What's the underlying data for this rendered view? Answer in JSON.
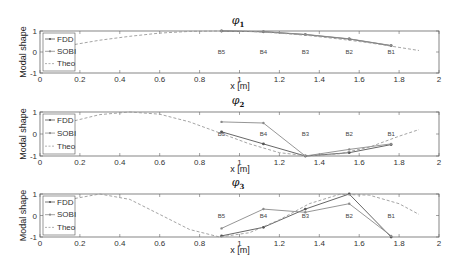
{
  "figure": {
    "ylabel": "Modal shape",
    "xlabel": "x [m]",
    "legend": [
      "FDD",
      "SOBI",
      "Theo"
    ],
    "colors": {
      "FDD": "#555555",
      "SOBI": "#8a8a8a",
      "Theo": "#9a9a9a"
    },
    "xticks": [
      "0",
      "0.2",
      "0.4",
      "0.6",
      "0.8",
      "1",
      "1.2",
      "1.4",
      "1.6",
      "1.8",
      "2"
    ],
    "yticks": [
      "-1",
      "0",
      "1"
    ]
  },
  "chart_data": [
    {
      "type": "line",
      "title": "φ1",
      "title_symbol": "φ",
      "title_sub": "1",
      "xlabel": "x [m]",
      "ylabel": "Modal shape",
      "xlim": [
        0,
        2
      ],
      "ylim": [
        -1,
        1
      ],
      "legend_position": "upper left",
      "annotations": [
        {
          "text": "B5",
          "x": 0.91
        },
        {
          "text": "B4",
          "x": 1.12
        },
        {
          "text": "B3",
          "x": 1.33
        },
        {
          "text": "B2",
          "x": 1.55
        },
        {
          "text": "B1",
          "x": 1.76
        }
      ],
      "series": [
        {
          "name": "FDD",
          "x": [
            0.91,
            1.12,
            1.33,
            1.55,
            1.76
          ],
          "y": [
            1.0,
            0.96,
            0.83,
            0.62,
            0.3
          ]
        },
        {
          "name": "SOBI",
          "x": [
            0.91,
            1.12,
            1.33,
            1.55,
            1.76
          ],
          "y": [
            1.0,
            0.97,
            0.84,
            0.63,
            0.31
          ]
        },
        {
          "name": "Theo",
          "x": [
            0.15,
            0.3,
            0.45,
            0.6,
            0.75,
            0.9,
            1.05,
            1.2,
            1.35,
            1.5,
            1.65,
            1.8,
            1.9
          ],
          "y": [
            0.32,
            0.56,
            0.75,
            0.9,
            0.98,
            1.0,
            0.98,
            0.9,
            0.78,
            0.62,
            0.44,
            0.22,
            0.07
          ]
        }
      ]
    },
    {
      "type": "line",
      "title": "φ2",
      "title_symbol": "φ",
      "title_sub": "2",
      "xlabel": "x [m]",
      "ylabel": "Modal shape",
      "xlim": [
        0,
        2
      ],
      "ylim": [
        -1,
        1
      ],
      "legend_position": "upper left",
      "annotations": [
        {
          "text": "B5",
          "x": 0.91
        },
        {
          "text": "B4",
          "x": 1.12
        },
        {
          "text": "B3",
          "x": 1.33
        },
        {
          "text": "B2",
          "x": 1.55
        },
        {
          "text": "B1",
          "x": 1.76
        }
      ],
      "series": [
        {
          "name": "FDD",
          "x": [
            0.91,
            1.12,
            1.33,
            1.55,
            1.76
          ],
          "y": [
            0.1,
            -0.45,
            -1.0,
            -0.85,
            -0.48
          ]
        },
        {
          "name": "SOBI",
          "x": [
            0.91,
            1.12,
            1.33,
            1.55,
            1.76
          ],
          "y": [
            0.55,
            0.5,
            -1.0,
            -0.7,
            -0.45
          ]
        },
        {
          "name": "Theo",
          "x": [
            0.15,
            0.3,
            0.45,
            0.6,
            0.75,
            0.9,
            1.05,
            1.2,
            1.35,
            1.5,
            1.65,
            1.8,
            1.9
          ],
          "y": [
            0.55,
            0.88,
            1.0,
            0.9,
            0.55,
            0.05,
            -0.45,
            -0.85,
            -1.0,
            -0.9,
            -0.6,
            -0.1,
            0.2
          ]
        }
      ]
    },
    {
      "type": "line",
      "title": "φ3",
      "title_symbol": "φ",
      "title_sub": "3",
      "xlabel": "x [m]",
      "ylabel": "Modal shape",
      "xlim": [
        0,
        2
      ],
      "ylim": [
        -1,
        1
      ],
      "legend_position": "upper left",
      "annotations": [
        {
          "text": "B5",
          "x": 0.91
        },
        {
          "text": "B4",
          "x": 1.12
        },
        {
          "text": "B3",
          "x": 1.33
        },
        {
          "text": "B2",
          "x": 1.55
        },
        {
          "text": "B1",
          "x": 1.76
        }
      ],
      "series": [
        {
          "name": "FDD",
          "x": [
            0.91,
            1.12,
            1.33,
            1.55,
            1.76
          ],
          "y": [
            -0.95,
            -0.55,
            0.3,
            1.0,
            -1.0
          ]
        },
        {
          "name": "SOBI",
          "x": [
            0.91,
            1.12,
            1.33,
            1.55,
            1.76
          ],
          "y": [
            -0.6,
            0.3,
            0.15,
            0.55,
            -0.95
          ]
        },
        {
          "name": "Theo",
          "x": [
            0.15,
            0.3,
            0.45,
            0.6,
            0.75,
            0.9,
            1.05,
            1.2,
            1.35,
            1.5,
            1.65,
            1.8,
            1.9
          ],
          "y": [
            0.75,
            1.0,
            0.75,
            0.05,
            -0.65,
            -1.0,
            -0.8,
            -0.2,
            0.55,
            0.98,
            0.95,
            0.55,
            0.05
          ]
        }
      ]
    }
  ]
}
